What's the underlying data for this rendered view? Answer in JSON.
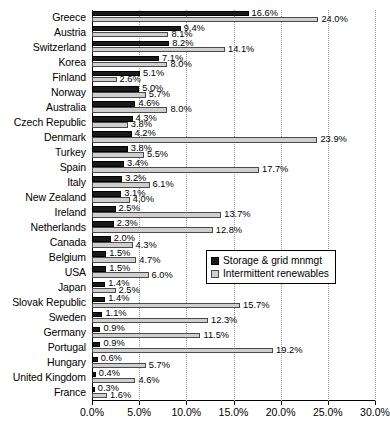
{
  "chart_data": {
    "type": "bar",
    "orientation": "horizontal",
    "title": "",
    "xlabel": "",
    "ylabel": "",
    "xlim": [
      0,
      30
    ],
    "xticks": [
      "0.0%",
      "5.0%",
      "10.0%",
      "15.0%",
      "20.0%",
      "25.0%",
      "30.0%"
    ],
    "xtick_values": [
      0,
      5,
      10,
      15,
      20,
      25,
      30
    ],
    "grid": true,
    "grid_axis": "x",
    "legend_position": "center-right",
    "value_suffix": "%",
    "categories": [
      "Greece",
      "Austria",
      "Switzerland",
      "Korea",
      "Finland",
      "Norway",
      "Australia",
      "Czech Republic",
      "Denmark",
      "Turkey",
      "Spain",
      "Italy",
      "New Zealand",
      "Ireland",
      "Netherlands",
      "Canada",
      "Belgium",
      "USA",
      "Japan",
      "Slovak Republic",
      "Sweden",
      "Germany",
      "Portugal",
      "Hungary",
      "United Kingdom",
      "France"
    ],
    "series": [
      {
        "name": "Storage & grid mnmgt",
        "color": "#1a1a1a",
        "values": [
          16.6,
          9.4,
          8.2,
          7.1,
          5.1,
          5.0,
          4.6,
          4.3,
          4.2,
          3.8,
          3.4,
          3.2,
          3.1,
          2.5,
          2.3,
          2.0,
          1.5,
          1.5,
          1.4,
          1.4,
          1.1,
          0.9,
          0.9,
          0.6,
          0.4,
          0.3
        ],
        "labels": [
          "16.6%",
          "9.4%",
          "8.2%",
          "7.1%",
          "5.1%",
          "5.0%",
          "4.6%",
          "4.3%",
          "4.2%",
          "3.8%",
          "3.4%",
          "3.2%",
          "3.1%",
          "2.5%",
          "2.3%",
          "2.0%",
          "1.5%",
          "1.5%",
          "1.4%",
          "1.4%",
          "1.1%",
          "0.9%",
          "0.9%",
          "0.6%",
          "0.4%",
          "0.3%"
        ]
      },
      {
        "name": "Intermittent renewables",
        "color": "#cfcfcf",
        "values": [
          24.0,
          8.1,
          14.1,
          8.0,
          2.6,
          5.7,
          8.0,
          3.8,
          23.9,
          5.5,
          17.7,
          6.1,
          4.0,
          13.7,
          12.8,
          4.3,
          4.7,
          6.0,
          2.5,
          15.7,
          12.3,
          11.5,
          19.2,
          5.7,
          4.6,
          1.6
        ],
        "labels": [
          "24.0%",
          "8.1%",
          "14.1%",
          "8.0%",
          "2.6%",
          "5.7%",
          "8.0%",
          "3.8%",
          "23.9%",
          "5.5%",
          "17.7%",
          "6.1%",
          "4.0%",
          "13.7%",
          "12.8%",
          "4.3%",
          "4.7%",
          "6.0%",
          "2.5%",
          "15.7%",
          "12.3%",
          "11.5%",
          "19.2%",
          "5.7%",
          "4.6%",
          "1.6%"
        ]
      }
    ]
  },
  "legend": {
    "items": [
      {
        "label": "Storage & grid mnmgt"
      },
      {
        "label": "Intermittent renewables"
      }
    ]
  }
}
